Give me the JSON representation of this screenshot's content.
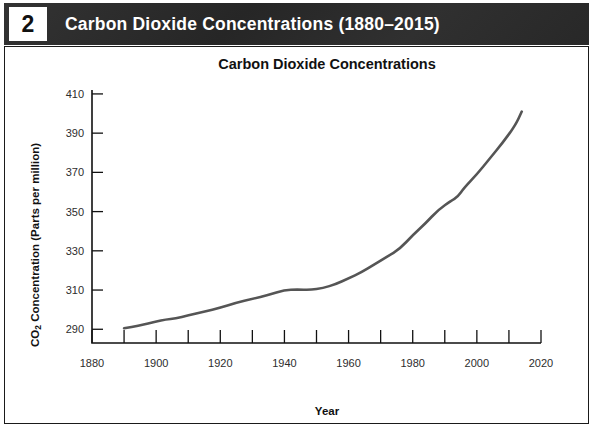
{
  "header": {
    "number": "2",
    "title": "Carbon Dioxide Concentrations (1880–2015)"
  },
  "chart_data": {
    "type": "line",
    "title": "Carbon Dioxide Concentrations",
    "xlabel": "Year",
    "ylabel": "CO₂ Concentration (Parts per million)",
    "ylabel_parts": {
      "prefix": "CO",
      "subscript": "2",
      "suffix": " Concentration (Parts per million)"
    },
    "xlim": [
      1880,
      2020
    ],
    "ylim": [
      283,
      412
    ],
    "xticks": [
      1880,
      1900,
      1920,
      1940,
      1960,
      1980,
      2000,
      2020
    ],
    "xtick_labels": [
      "1880",
      "1900",
      "1920",
      "1940",
      "1960",
      "1980",
      "2000",
      "2020"
    ],
    "xticks_minor": [
      1890,
      1910,
      1930,
      1950,
      1970,
      1990,
      2010
    ],
    "yticks": [
      290,
      310,
      330,
      350,
      370,
      390,
      410
    ],
    "ytick_labels": [
      "290",
      "310",
      "330",
      "350",
      "370",
      "390",
      "410"
    ],
    "grid": false,
    "legend": null,
    "line_color": "#555555",
    "series": [
      {
        "name": "CO2 concentration",
        "x": [
          1890,
          1895,
          1900,
          1903,
          1906,
          1910,
          1915,
          1920,
          1925,
          1930,
          1935,
          1940,
          1944,
          1948,
          1952,
          1956,
          1960,
          1964,
          1968,
          1972,
          1976,
          1980,
          1984,
          1988,
          1992,
          1994,
          1996,
          2000,
          2004,
          2008,
          2012,
          2014
        ],
        "y": [
          290.5,
          292.0,
          294.0,
          295.0,
          295.5,
          297.0,
          299.0,
          301.0,
          303.5,
          305.5,
          307.5,
          310.0,
          310.3,
          310.0,
          311.0,
          313.0,
          316.0,
          319.0,
          323.0,
          327.0,
          331.0,
          338.0,
          344.0,
          351.0,
          355.5,
          357.5,
          362.0,
          369.0,
          377.0,
          385.0,
          394.0,
          401.0
        ]
      }
    ]
  }
}
